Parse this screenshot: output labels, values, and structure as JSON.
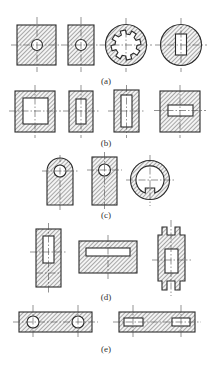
{
  "figure": {
    "colors": {
      "line": "#2a2a2a",
      "hatch": "#5a5a5a",
      "background": "#ffffff"
    },
    "groups": [
      {
        "label": "(a)",
        "items": [
          "square-with-round-hole",
          "rectangle-with-round-hole",
          "ring-with-spline-hole",
          "disc-with-rectangular-slot"
        ]
      },
      {
        "label": "(b)",
        "items": [
          "square-frame-square-hole",
          "rectangle-with-narrow-slot",
          "rectangle-with-long-slot",
          "square-with-horizontal-slot"
        ]
      },
      {
        "label": "(c)",
        "items": [
          "lug-with-round-hole",
          "rectangle-with-round-hole-near-top",
          "ring-with-keyway"
        ]
      },
      {
        "label": "(d)",
        "items": [
          "tall-block-with-slot",
          "wide-block-with-long-slot",
          "forked-block-with-window"
        ]
      },
      {
        "label": "(e)",
        "items": [
          "bar-with-two-round-holes",
          "bar-with-two-rectangular-slots"
        ]
      }
    ]
  }
}
